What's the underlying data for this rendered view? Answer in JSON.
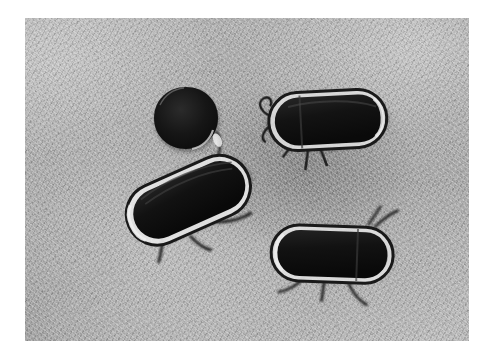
{
  "image": {
    "type": "photograph",
    "subject": "four dark beetle specimens on a fibrous gray substrate",
    "color_mode": "grayscale",
    "caption": "",
    "frame": {
      "border_color": "#ffffff",
      "left": 25,
      "top": 18,
      "width": 444,
      "height": 323
    },
    "background": {
      "name": "fibrous-substrate",
      "base_color": "#a8a8a8",
      "light_color": "#c6c6c6",
      "dark_color": "#8a8a8a",
      "texture": "matted fibres with dark speckles"
    },
    "specimens": [
      {
        "id": "specimen-round-top-left",
        "shape": "round",
        "label": "round dark beetle, dorsal view",
        "x": 140,
        "y": 72,
        "width": 62,
        "height": 60,
        "rotation": 0,
        "body_color": "#191919",
        "rim_color": "#d6d6d6"
      },
      {
        "id": "specimen-oval-top-right",
        "shape": "oval",
        "label": "elongated oval beetle, horizontal",
        "x": 249,
        "y": 80,
        "width": 115,
        "height": 58,
        "rotation": -3,
        "body_color": "#171717",
        "rim_color": "#e4e4e4"
      },
      {
        "id": "specimen-oval-middle-left",
        "shape": "oval",
        "label": "elongated oval beetle, tilted",
        "x": 128,
        "y": 158,
        "width": 120,
        "height": 62,
        "rotation": -24,
        "body_color": "#161616",
        "rim_color": "#e8e8e8"
      },
      {
        "id": "specimen-oval-bottom-right",
        "shape": "oval",
        "label": "elongated oval beetle, horizontal",
        "x": 262,
        "y": 210,
        "width": 106,
        "height": 56,
        "rotation": 2,
        "body_color": "#161616",
        "rim_color": "#e2e2e2"
      }
    ]
  }
}
